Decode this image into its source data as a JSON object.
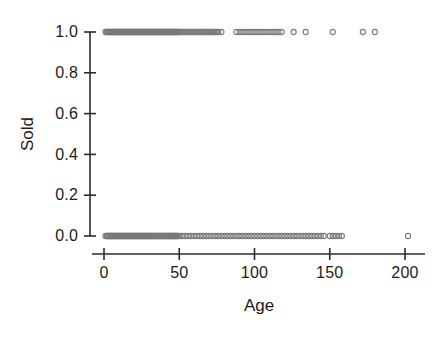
{
  "figure": {
    "background_color": "#ffffff",
    "width": 445,
    "height": 337
  },
  "chart_data": {
    "type": "scatter",
    "title": "",
    "xlabel": "Age",
    "ylabel": "Sold",
    "xlim": [
      -4,
      214
    ],
    "ylim": [
      -0.06,
      1.06
    ],
    "grid": false,
    "legend": null,
    "marker": {
      "shape": "open-circle",
      "radius_px": 2.6,
      "stroke_color": "#7a7a7a",
      "fill": "none",
      "stroke_width": 1.1
    },
    "xticks": [
      0,
      50,
      100,
      150,
      200
    ],
    "xticklabels": [
      "0",
      "50",
      "100",
      "150",
      "200"
    ],
    "yticks": [
      0.0,
      0.2,
      0.4,
      0.6,
      0.8,
      1.0
    ],
    "yticklabels": [
      "0.0",
      "0.2",
      "0.4",
      "0.6",
      "0.8",
      "1.0"
    ],
    "axis_color": "#2b2b2b",
    "x": [
      1,
      2,
      2,
      3,
      3,
      4,
      4,
      5,
      5,
      6,
      6,
      7,
      7,
      8,
      8,
      9,
      9,
      10,
      10,
      11,
      11,
      12,
      12,
      13,
      13,
      14,
      14,
      15,
      15,
      16,
      16,
      17,
      17,
      18,
      18,
      19,
      19,
      20,
      20,
      21,
      21,
      22,
      22,
      23,
      23,
      24,
      24,
      25,
      25,
      26,
      26,
      27,
      27,
      28,
      28,
      29,
      29,
      30,
      30,
      31,
      31,
      32,
      32,
      33,
      33,
      34,
      34,
      35,
      35,
      36,
      36,
      37,
      37,
      38,
      38,
      39,
      39,
      40,
      40,
      41,
      41,
      42,
      42,
      43,
      43,
      44,
      44,
      45,
      45,
      46,
      46,
      47,
      47,
      48,
      48,
      49,
      49,
      50,
      50,
      51,
      52,
      53,
      54,
      55,
      56,
      57,
      58,
      59,
      60,
      61,
      62,
      63,
      64,
      65,
      66,
      67,
      68,
      69,
      70,
      71,
      72,
      73,
      74,
      75,
      76,
      78,
      88,
      90,
      92,
      94,
      96,
      98,
      100,
      102,
      104,
      106,
      108,
      110,
      112,
      114,
      116,
      118,
      126,
      134,
      152,
      172,
      180,
      1,
      2,
      2,
      3,
      3,
      4,
      4,
      5,
      5,
      6,
      6,
      7,
      7,
      8,
      8,
      9,
      9,
      10,
      10,
      11,
      11,
      12,
      12,
      13,
      13,
      14,
      14,
      15,
      15,
      16,
      16,
      17,
      17,
      18,
      18,
      19,
      19,
      20,
      20,
      21,
      21,
      22,
      22,
      23,
      23,
      24,
      24,
      25,
      25,
      26,
      26,
      27,
      27,
      28,
      28,
      29,
      29,
      30,
      30,
      31,
      31,
      32,
      32,
      33,
      33,
      34,
      34,
      35,
      35,
      36,
      36,
      37,
      37,
      38,
      38,
      39,
      39,
      40,
      40,
      41,
      41,
      42,
      42,
      43,
      43,
      44,
      44,
      45,
      45,
      46,
      46,
      47,
      47,
      48,
      48,
      49,
      50,
      52,
      54,
      56,
      58,
      60,
      62,
      64,
      66,
      68,
      70,
      72,
      74,
      76,
      78,
      80,
      82,
      84,
      86,
      88,
      90,
      92,
      94,
      96,
      98,
      100,
      102,
      104,
      106,
      108,
      110,
      112,
      114,
      116,
      118,
      120,
      122,
      124,
      126,
      128,
      130,
      132,
      134,
      136,
      138,
      140,
      142,
      144,
      146,
      150,
      152,
      154,
      156,
      158,
      202
    ],
    "y": [
      1,
      1,
      1,
      1,
      1,
      1,
      1,
      1,
      1,
      1,
      1,
      1,
      1,
      1,
      1,
      1,
      1,
      1,
      1,
      1,
      1,
      1,
      1,
      1,
      1,
      1,
      1,
      1,
      1,
      1,
      1,
      1,
      1,
      1,
      1,
      1,
      1,
      1,
      1,
      1,
      1,
      1,
      1,
      1,
      1,
      1,
      1,
      1,
      1,
      1,
      1,
      1,
      1,
      1,
      1,
      1,
      1,
      1,
      1,
      1,
      1,
      1,
      1,
      1,
      1,
      1,
      1,
      1,
      1,
      1,
      1,
      1,
      1,
      1,
      1,
      1,
      1,
      1,
      1,
      1,
      1,
      1,
      1,
      1,
      1,
      1,
      1,
      1,
      1,
      1,
      1,
      1,
      1,
      1,
      1,
      1,
      1,
      1,
      1,
      1,
      1,
      1,
      1,
      1,
      1,
      1,
      1,
      1,
      1,
      1,
      1,
      1,
      1,
      1,
      1,
      1,
      1,
      1,
      1,
      1,
      1,
      1,
      1,
      1,
      1,
      1,
      1,
      1,
      1,
      1,
      1,
      1,
      1,
      1,
      1,
      1,
      1,
      1,
      1,
      1,
      1,
      1,
      1,
      1,
      1,
      1,
      1,
      0,
      0,
      0,
      0,
      0,
      0,
      0,
      0,
      0,
      0,
      0,
      0,
      0,
      0,
      0,
      0,
      0,
      0,
      0,
      0,
      0,
      0,
      0,
      0,
      0,
      0,
      0,
      0,
      0,
      0,
      0,
      0,
      0,
      0,
      0,
      0,
      0,
      0,
      0,
      0,
      0,
      0,
      0,
      0,
      0,
      0,
      0,
      0,
      0,
      0,
      0,
      0,
      0,
      0,
      0,
      0,
      0,
      0,
      0,
      0,
      0,
      0,
      0,
      0,
      0,
      0,
      0,
      0,
      0,
      0,
      0,
      0,
      0,
      0,
      0,
      0,
      0,
      0,
      0,
      0,
      0,
      0,
      0,
      0,
      0,
      0,
      0,
      0,
      0,
      0,
      0,
      0,
      0,
      0,
      0,
      0,
      0,
      0,
      0,
      0,
      0,
      0,
      0,
      0,
      0,
      0,
      0,
      0,
      0,
      0,
      0,
      0,
      0,
      0,
      0,
      0,
      0,
      0,
      0,
      0,
      0,
      0,
      0,
      0,
      0,
      0,
      0,
      0,
      0,
      0,
      0,
      0,
      0,
      0,
      0,
      0,
      0,
      0,
      0,
      0,
      0,
      0,
      0,
      0,
      0,
      0,
      0,
      0,
      0,
      0,
      0
    ]
  },
  "geometry": {
    "x_axis_y_px": 254,
    "y_axis_x_px": 90,
    "x0_px": 104,
    "x200_px": 405,
    "y0_px": 236,
    "y1_px": 32,
    "x_axis_left_px": 92,
    "x_axis_right_px": 425,
    "tick_len_px": 6
  }
}
